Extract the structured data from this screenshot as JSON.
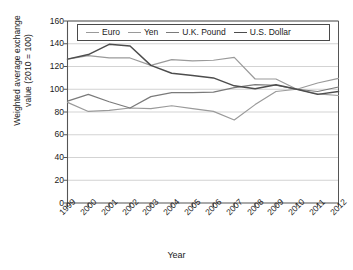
{
  "chart_data": {
    "type": "line",
    "title": "",
    "xlabel": "Year",
    "ylabel": "Weighted average exchange value (2010 = 100)",
    "ylabel_line1": "Weighted average exchange",
    "ylabel_line2": "value (2010 = 100)",
    "categories": [
      "1999",
      "2000",
      "2001",
      "2002",
      "2003",
      "2004",
      "2005",
      "2006",
      "2007",
      "2008",
      "2009",
      "2010",
      "2011",
      "2012"
    ],
    "x": [
      1999,
      2000,
      2001,
      2002,
      2003,
      2004,
      2005,
      2006,
      2007,
      2008,
      2009,
      2010,
      2011,
      2012
    ],
    "ylim": [
      0,
      160
    ],
    "yticks": [
      0,
      20,
      40,
      60,
      80,
      100,
      120,
      140,
      160
    ],
    "ytick_labels": [
      "0",
      "20",
      "40",
      "60",
      "80",
      "100",
      "120",
      "140",
      "160"
    ],
    "grid": "horizontal",
    "legend_position": "top-inside",
    "series": [
      {
        "name": "Euro",
        "color": "#9a9a9a",
        "values": [
          126.5,
          129.5,
          127.5,
          127.5,
          121.0,
          126.0,
          125.0,
          125.5,
          128.0,
          109.0,
          109.0,
          100.0,
          96.0,
          94.5
        ]
      },
      {
        "name": "Yen",
        "color": "#9a9a9a",
        "values": [
          88.5,
          80.5,
          81.5,
          83.5,
          83.0,
          85.5,
          83.0,
          80.5,
          73.0,
          86.5,
          98.0,
          100.0,
          105.5,
          109.5
        ]
      },
      {
        "name": "U.K. Pound",
        "color": "#7a7a7a",
        "values": [
          89.5,
          95.5,
          89.0,
          83.5,
          93.5,
          97.0,
          97.0,
          97.5,
          101.5,
          104.0,
          103.5,
          100.0,
          98.0,
          102.0
        ]
      },
      {
        "name": "U.S. Dollar",
        "color": "#4d4d4d",
        "values": [
          126.5,
          130.5,
          139.5,
          138.0,
          121.0,
          114.0,
          112.0,
          110.0,
          103.0,
          100.5,
          104.0,
          100.0,
          95.5,
          98.0
        ]
      }
    ]
  }
}
